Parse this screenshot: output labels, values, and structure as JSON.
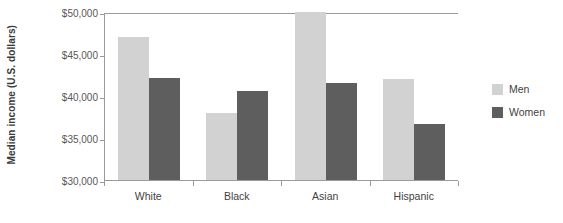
{
  "chart_data": {
    "type": "bar",
    "title": "",
    "xlabel": "",
    "ylabel": "Median income (U.S. dollars)",
    "categories": [
      "White",
      "Black",
      "Asian",
      "Hispanic"
    ],
    "series": [
      {
        "name": "Men",
        "color": "#d2d2d2",
        "values": [
          47000,
          38000,
          50200,
          42000
        ]
      },
      {
        "name": "Women",
        "color": "#5e5e5e",
        "values": [
          42100,
          40600,
          41600,
          36700
        ]
      }
    ],
    "ylim": [
      30000,
      50000
    ],
    "yticks": [
      30000,
      35000,
      40000,
      45000,
      50000
    ],
    "ytick_labels": [
      "$30,000",
      "$35,000",
      "$40,000",
      "$45,000",
      "$50,000"
    ],
    "grid": false,
    "legend_position": "right"
  },
  "legend": {
    "items": [
      {
        "label": "Men"
      },
      {
        "label": "Women"
      }
    ]
  }
}
